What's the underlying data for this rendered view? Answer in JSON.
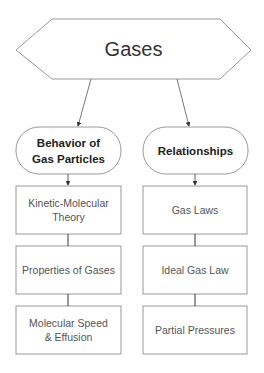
{
  "diagram": {
    "root": {
      "label": "Gases",
      "shape": "hexagon"
    },
    "branches": [
      {
        "label": "Behavior of Gas Particles",
        "label_line1": "Behavior of",
        "label_line2": "Gas Particles",
        "shape": "rounded",
        "children": [
          {
            "line1": "Kinetic-Molecular",
            "line2": "Theory"
          },
          {
            "line1": "Properties of Gases",
            "line2": ""
          },
          {
            "line1": "Molecular Speed",
            "line2": "& Effusion"
          }
        ]
      },
      {
        "label": "Relationships",
        "label_line1": "Relationships",
        "label_line2": "",
        "shape": "rounded",
        "children": [
          {
            "line1": "Gas Laws",
            "line2": ""
          },
          {
            "line1": "Ideal Gas Law",
            "line2": ""
          },
          {
            "line1": "Partial Pressures",
            "line2": ""
          }
        ]
      }
    ],
    "colors": {
      "stroke": "#999999",
      "connector": "#333333",
      "background": "#ffffff"
    }
  }
}
